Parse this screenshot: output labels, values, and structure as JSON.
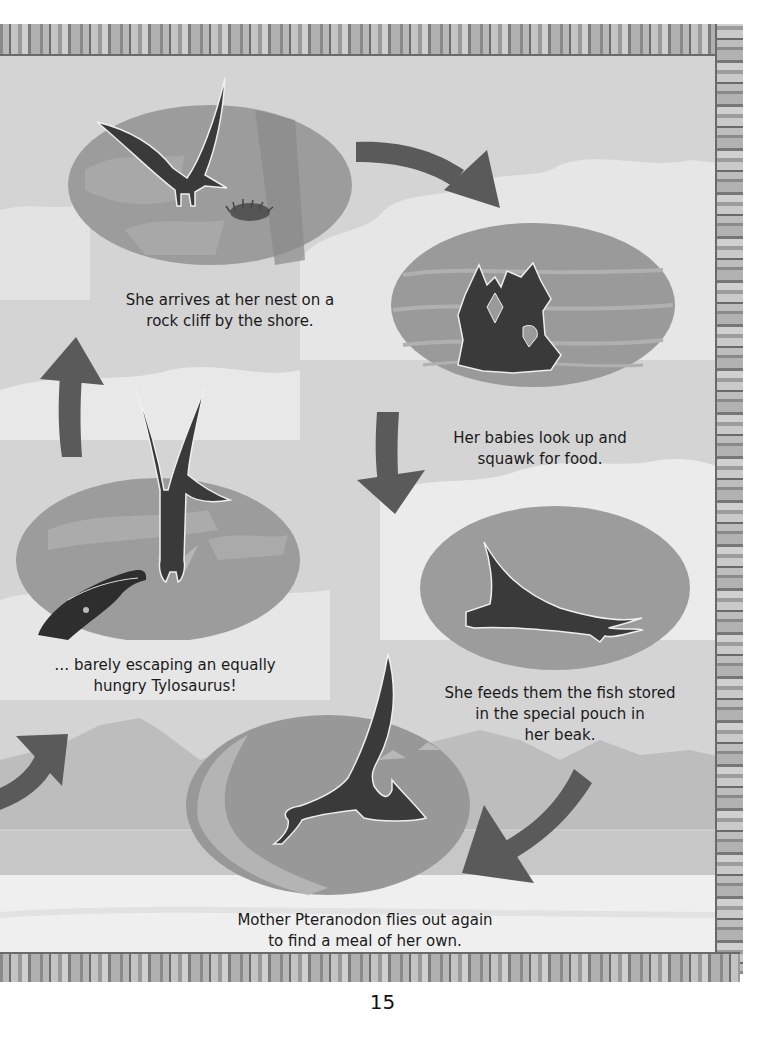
{
  "page": {
    "number": "15",
    "colors": {
      "sky": "#d6d6d6",
      "cloud": "#eaeaea",
      "mountain": "#bcbcbc",
      "ground": "#f0f0f0",
      "oval": "#9a9a9a",
      "oval_dark": "#858585",
      "silhouette": "#3a3a3a",
      "arrow": "#5a5a5a",
      "text": "#1a1a1a"
    }
  },
  "cycle": {
    "steps": [
      {
        "id": "arrive-nest",
        "illustration": "pteranodon-flying-to-nest",
        "caption": "She arrives at her nest on a\nrock cliff by the shore."
      },
      {
        "id": "babies-squawk",
        "illustration": "baby-pteranodons-in-nest",
        "caption": "Her babies look up and\nsquawk for food."
      },
      {
        "id": "feeds-babies",
        "illustration": "pteranodon-feeding",
        "caption": "She feeds them the fish stored\nin the special pouch in\nher beak."
      },
      {
        "id": "flies-out",
        "illustration": "pteranodon-skimming-water",
        "caption": "Mother Pteranodon flies out again\nto find a meal of her own."
      },
      {
        "id": "escapes-tylosaurus",
        "illustration": "pteranodon-escaping-tylosaurus",
        "caption": "… barely escaping an equally\nhungry Tylosaurus!"
      }
    ],
    "arrows": [
      {
        "from": "arrive-nest",
        "to": "babies-squawk",
        "direction": "right-down"
      },
      {
        "from": "babies-squawk",
        "to": "feeds-babies",
        "direction": "down"
      },
      {
        "from": "feeds-babies",
        "to": "flies-out",
        "direction": "down-left"
      },
      {
        "from": "flies-out",
        "to": "escapes-tylosaurus",
        "direction": "up-right-offpage"
      },
      {
        "from": "escapes-tylosaurus",
        "to": "arrive-nest",
        "direction": "up"
      }
    ]
  }
}
